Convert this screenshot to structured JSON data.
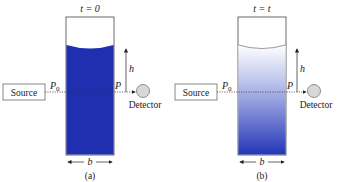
{
  "panels": [
    {
      "id": "a",
      "time_label": "t = 0",
      "source_label": "Source",
      "detector_label": "Detector",
      "p0_label": "P",
      "p0_sub": "0",
      "p_label": "P",
      "height_label": "h",
      "width_label": "b",
      "caption": "(a)",
      "fill": "uniform",
      "liquid_color": "#1f2fb0"
    },
    {
      "id": "b",
      "time_label": "t = t",
      "source_label": "Source",
      "detector_label": "Detector",
      "p0_label": "P",
      "p0_sub": "0",
      "p_label": "P",
      "height_label": "h",
      "width_label": "b",
      "caption": "(b)",
      "fill": "gradient",
      "liquid_color_top": "#ffffff",
      "liquid_color_bottom": "#2436b8"
    }
  ]
}
